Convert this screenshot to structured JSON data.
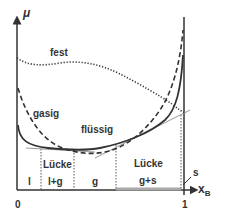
{
  "axes": {
    "y_label": "μ",
    "x_label": "x",
    "x_label_sub": "B",
    "x_tick_0": "0",
    "x_tick_1": "1"
  },
  "curves": {
    "solid_label": "fest",
    "gas_label": "gasig",
    "liquid_label": "flüssig"
  },
  "regions": {
    "r1": "l",
    "r2_top": "Lücke",
    "r2_bottom": "l+g",
    "r3": "g",
    "r4_top": "Lücke",
    "r4_bottom": "g+s",
    "r5": "s"
  },
  "colors": {
    "line": "#333333",
    "tangent": "#999999",
    "bar": "#aaaaaa"
  }
}
